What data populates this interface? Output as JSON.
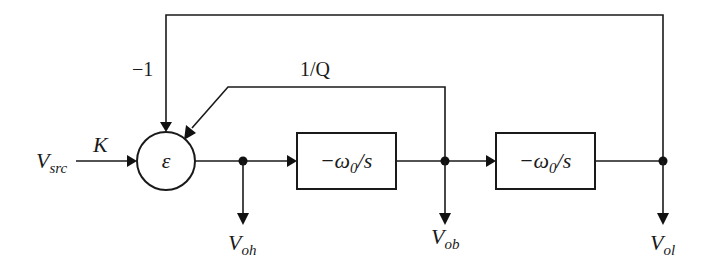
{
  "diagram": {
    "type": "block-diagram",
    "input": {
      "label": "V",
      "sub": "src",
      "gain": "K"
    },
    "summer": {
      "label": "ε"
    },
    "feedback": [
      {
        "label": "−1",
        "from": "V_ol"
      },
      {
        "label": "1/Q",
        "from": "V_ob"
      }
    ],
    "blocks": [
      {
        "id": "integrator-1",
        "label_pre": "−ω",
        "label_sub": "0",
        "label_post": "/s"
      },
      {
        "id": "integrator-2",
        "label_pre": "−ω",
        "label_sub": "0",
        "label_post": "/s"
      }
    ],
    "outputs": [
      {
        "label": "V",
        "sub": "oh"
      },
      {
        "label": "V",
        "sub": "ob"
      },
      {
        "label": "V",
        "sub": "ol"
      }
    ]
  }
}
